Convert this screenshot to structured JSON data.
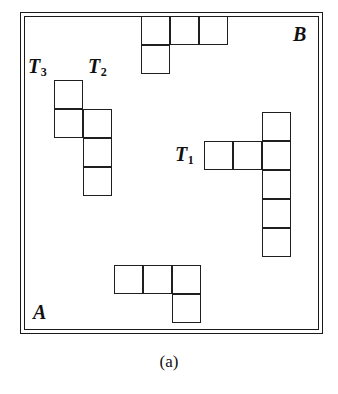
{
  "figure": {
    "caption": "(a)",
    "caption_y": 352,
    "line_color": "#1f1f1f",
    "background_color": "#ffffff",
    "cell_size": 29
  },
  "region": {
    "name": "bounding-region",
    "x": 20,
    "y": 12,
    "width": 303,
    "height": 322,
    "inner_inset": 3
  },
  "corner_labels": [
    {
      "name": "corner-label-b",
      "text": "B",
      "x": 293,
      "y": 24
    },
    {
      "name": "corner-label-a",
      "text": "A",
      "x": 33,
      "y": 302
    }
  ],
  "piece_labels": [
    {
      "name": "piece-label-t3",
      "base": "T",
      "sub": "3",
      "x": 28,
      "y": 56
    },
    {
      "name": "piece-label-t2",
      "base": "T",
      "sub": "2",
      "x": 88,
      "y": 56
    },
    {
      "name": "piece-label-t1",
      "base": "T",
      "sub": "1",
      "x": 175,
      "y": 144
    }
  ],
  "pieces": [
    {
      "name": "polyomino-top",
      "id": "top-piece",
      "origin": {
        "x": 141,
        "y": 16
      },
      "cells": [
        {
          "col": 0,
          "row": 0
        },
        {
          "col": 1,
          "row": 0
        },
        {
          "col": 2,
          "row": 0
        },
        {
          "col": 0,
          "row": 1
        }
      ]
    },
    {
      "name": "polyomino-t2-t3",
      "id": "left-piece",
      "origin": {
        "x": 54,
        "y": 80
      },
      "cells": [
        {
          "col": 0,
          "row": 0
        },
        {
          "col": 0,
          "row": 1
        },
        {
          "col": 1,
          "row": 1
        },
        {
          "col": 1,
          "row": 2
        },
        {
          "col": 1,
          "row": 3
        }
      ]
    },
    {
      "name": "polyomino-t1",
      "id": "right-piece",
      "origin": {
        "x": 204,
        "y": 112
      },
      "cells": [
        {
          "col": 2,
          "row": 0
        },
        {
          "col": 0,
          "row": 1
        },
        {
          "col": 1,
          "row": 1
        },
        {
          "col": 2,
          "row": 1
        },
        {
          "col": 2,
          "row": 2
        },
        {
          "col": 2,
          "row": 3
        },
        {
          "col": 2,
          "row": 4
        }
      ]
    },
    {
      "name": "polyomino-bottom",
      "id": "bottom-piece",
      "origin": {
        "x": 114,
        "y": 265
      },
      "cells": [
        {
          "col": 0,
          "row": 0
        },
        {
          "col": 1,
          "row": 0
        },
        {
          "col": 2,
          "row": 0
        },
        {
          "col": 2,
          "row": 1
        }
      ]
    }
  ]
}
